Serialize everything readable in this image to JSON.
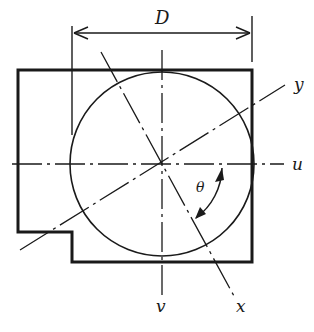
{
  "diagram": {
    "title": "",
    "labels": {
      "dimension": "D",
      "axis_u": "u",
      "axis_v": "v",
      "axis_x": "x",
      "axis_y": "y",
      "angle": "θ"
    },
    "colors": {
      "ink": "#1a1a1a",
      "background": "#ffffff"
    }
  }
}
